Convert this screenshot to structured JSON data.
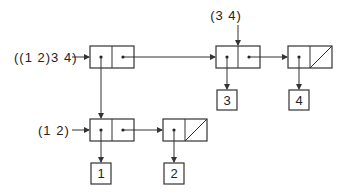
{
  "labels": {
    "outer_list": "((1 2)3 4)",
    "sublist_34": "(3 4)",
    "sublist_12": "(1 2)"
  },
  "atoms": {
    "a1": "1",
    "a2": "2",
    "a3": "3",
    "a4": "4"
  },
  "diagram": {
    "type": "cons-cell box-and-pointer diagram",
    "cells": [
      {
        "id": "c1",
        "car": "c3",
        "cdr": "c2",
        "label": "((1 2)3 4)"
      },
      {
        "id": "c2",
        "car": "3",
        "cdr": "c4",
        "label": "(3 4)"
      },
      {
        "id": "c4",
        "car": "4",
        "cdr": "nil"
      },
      {
        "id": "c3",
        "car": "1",
        "cdr": "c5",
        "label": "(1 2)"
      },
      {
        "id": "c5",
        "car": "2",
        "cdr": "nil"
      }
    ]
  }
}
